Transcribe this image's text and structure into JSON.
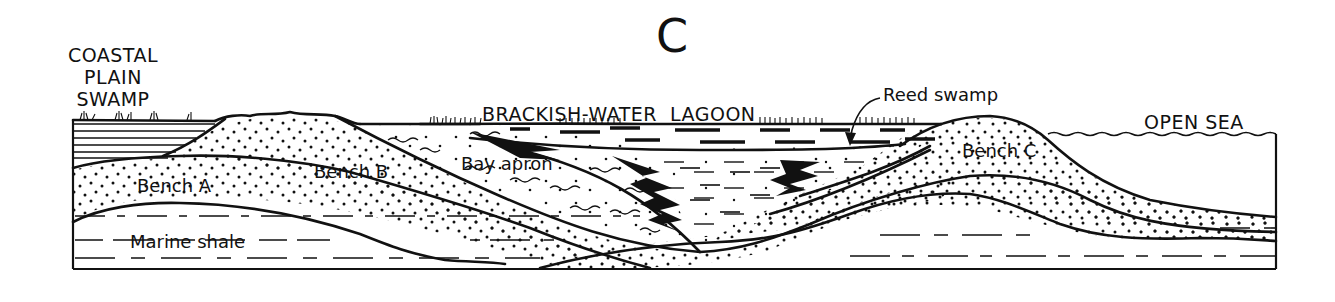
{
  "figure": {
    "panel_label": "C",
    "type": "geological cross-section"
  },
  "environments": {
    "coastal_plain_swamp": [
      "COASTAL",
      "PLAIN",
      "SWAMP"
    ],
    "lagoon": "BRACKISH-WATER  LAGOON",
    "reed_swamp": "Reed swamp",
    "open_sea": "OPEN SEA"
  },
  "units": {
    "bench_a": "Bench A",
    "bench_b": "Bench B",
    "bench_c": "Bench C",
    "bay_apron": "Bay apron",
    "marine_shale": "Marine shale"
  },
  "colors": {
    "ink": "#111111",
    "paper": "#ffffff"
  }
}
